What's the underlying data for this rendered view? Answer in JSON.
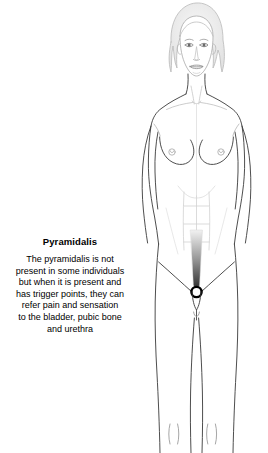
{
  "canvas": {
    "width": 268,
    "height": 453,
    "background": "#ffffff"
  },
  "caption": {
    "title": "Pyramidalis",
    "lines": [
      "The pyramidalis is not",
      "present in some individuals",
      "but when it is present and",
      "has trigger points, they can",
      "refer pain and sensation",
      "to the bladder, pubic bone",
      "and urethra"
    ],
    "full_text": "The pyramidalis is not present in some individuals but when it is present and has trigger points, they can refer pain and sensation to the bladder, pubic bone and urethra",
    "text_color": "#000000",
    "title_weight": "bold"
  },
  "figure": {
    "view": "anterior",
    "line_color": "#3a3a3a",
    "faint_line_color": "#c8c8c8",
    "hair_fill": "#f0f0f0",
    "skin_fill": "#ffffff",
    "parts": [
      {
        "name": "hair",
        "label": "Hair"
      },
      {
        "name": "face",
        "label": "Face"
      },
      {
        "name": "neck",
        "label": "Neck"
      },
      {
        "name": "clavicle",
        "label": "Clavicle"
      },
      {
        "name": "shoulder",
        "label": "Shoulder"
      },
      {
        "name": "arm",
        "label": "Arm"
      },
      {
        "name": "breast",
        "label": "Breast"
      },
      {
        "name": "rectus-abdominis",
        "label": "Rectus abdominis"
      },
      {
        "name": "navel",
        "label": "Navel"
      },
      {
        "name": "pyramidalis-muscle",
        "label": "Pyramidalis"
      },
      {
        "name": "trigger-point",
        "label": "Trigger point"
      },
      {
        "name": "pubic-region",
        "label": "Pubic region"
      },
      {
        "name": "thigh",
        "label": "Thigh"
      },
      {
        "name": "knee",
        "label": "Knee"
      }
    ]
  },
  "muscle_highlight": {
    "name": "pyramidalis",
    "shape": "teardrop",
    "fill_dark": "#2b2b2b",
    "fill_light": "#e6e6e6",
    "position": {
      "x": 196,
      "y": 268
    }
  },
  "trigger_point": {
    "marker": "ring",
    "ring_color": "#000000",
    "center_fill": "#ffffff",
    "radius": 5,
    "position": {
      "x": 196,
      "y": 292
    }
  }
}
